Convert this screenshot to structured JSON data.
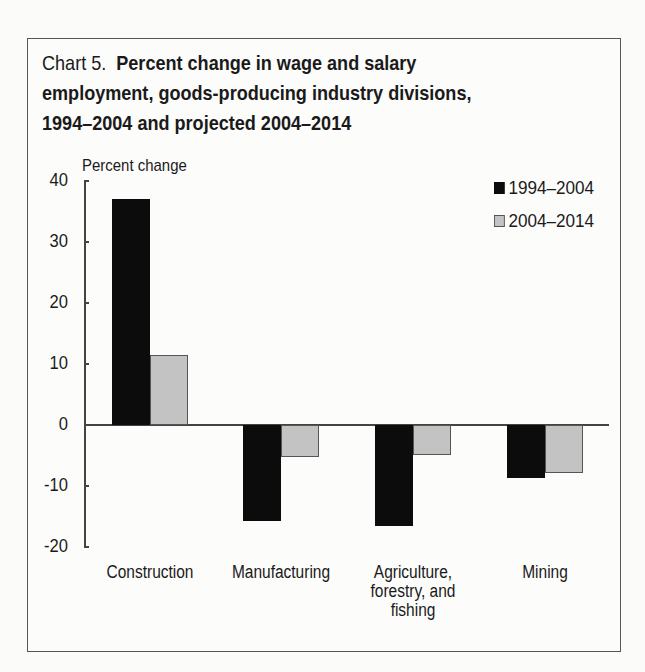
{
  "chart_data": {
    "type": "bar",
    "title_prefix": "Chart 5.",
    "title": "Percent change in wage and salary employment, goods-producing industry divisions, 1994–2004 and projected 2004–2014",
    "title_lines": [
      "Percent change in wage and salary",
      "employment, goods-producing industry divisions,",
      "1994–2004 and projected 2004–2014"
    ],
    "xlabel": "",
    "ylabel": "Percent change",
    "ylim": [
      -20,
      40
    ],
    "yticks": [
      40,
      30,
      20,
      10,
      0,
      -10,
      -20
    ],
    "ytick_labels": [
      "40",
      "30",
      "20",
      "10",
      "0",
      "-10",
      "-20"
    ],
    "categories": [
      "Construction",
      "Manufacturing",
      "Agriculture, forestry, and fishing",
      "Mining"
    ],
    "category_lines": [
      [
        "Construction"
      ],
      [
        "Manufacturing"
      ],
      [
        "Agriculture,",
        "forestry, and",
        "fishing"
      ],
      [
        "Mining"
      ]
    ],
    "series": [
      {
        "name": "1994–2004",
        "color": "#0c0c0c",
        "values": [
          37.0,
          -15.7,
          -16.5,
          -8.7
        ]
      },
      {
        "name": "2004–2014",
        "color": "#c3c3c3",
        "values": [
          11.5,
          -5.2,
          -4.9,
          -7.9
        ]
      }
    ],
    "grid": false,
    "legend_position": "top-right"
  }
}
